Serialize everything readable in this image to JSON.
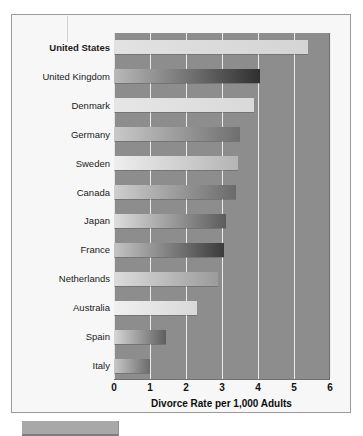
{
  "chart_data": {
    "type": "bar",
    "orientation": "horizontal",
    "title": "",
    "xlabel": "Divorce Rate per 1,000 Adults",
    "ylabel": "",
    "xlim": [
      0,
      6
    ],
    "xticks": [
      0,
      1,
      2,
      3,
      4,
      5,
      6
    ],
    "xtick_labels": [
      "0",
      "1",
      "2",
      "3",
      "4",
      "5",
      "6"
    ],
    "grid": true,
    "grid_axis": "x",
    "legend": false,
    "categories": [
      "United States",
      "United Kingdom",
      "Denmark",
      "Germany",
      "Sweden",
      "Canada",
      "Japan",
      "France",
      "Netherlands",
      "Australia",
      "Spain",
      "Italy"
    ],
    "values": [
      5.4,
      4.05,
      3.9,
      3.5,
      3.45,
      3.4,
      3.1,
      3.05,
      2.9,
      2.3,
      1.45,
      1.0
    ],
    "emphasized_category": "United States",
    "bar_colors_start": [
      "#e2e2e2",
      "#b9b9b9",
      "#e6e6e6",
      "#c9c9c9",
      "#eeeeee",
      "#cfcfcf",
      "#dedede",
      "#c4c4c4",
      "#dcdcdc",
      "#f0f0f0",
      "#d6d6d6",
      "#c8c8c8"
    ],
    "bar_colors_end": [
      "#d4d4d4",
      "#2f2f2f",
      "#d9d9d9",
      "#6f6f6f",
      "#b4b4b4",
      "#6a6a6a",
      "#5c5c5c",
      "#3b3b3b",
      "#9b9b9b",
      "#d8d8d8",
      "#5e5e5e",
      "#6b6b6b"
    ],
    "plot_background": "#8d8d8d",
    "gridline_color": "#ededed",
    "figure_background": "#f7f7f7",
    "figure_border": "#9a9a9a"
  }
}
